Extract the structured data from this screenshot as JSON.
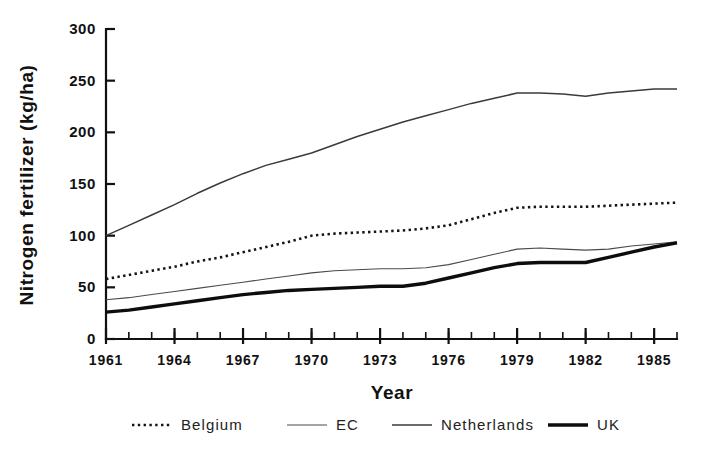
{
  "chart_data": {
    "type": "line",
    "title": "",
    "xlabel": "Year",
    "ylabel": "Nitrogen fertilizer (kg/ha)",
    "xlim": [
      1961,
      1986
    ],
    "ylim": [
      0,
      300
    ],
    "yticks": [
      0,
      50,
      100,
      150,
      200,
      250,
      300
    ],
    "ytick_labels": [
      "0",
      "50",
      "100",
      "150",
      "200",
      "250",
      "300"
    ],
    "xticks": [
      1961,
      1964,
      1967,
      1970,
      1973,
      1976,
      1979,
      1982,
      1985
    ],
    "xtick_labels": [
      "1961",
      "1964",
      "1967",
      "1970",
      "1973",
      "1976",
      "1979",
      "1982",
      "1985"
    ],
    "x_minor_interval": 1,
    "grid": false,
    "legend_position": "below",
    "x": [
      1961,
      1962,
      1963,
      1964,
      1965,
      1966,
      1967,
      1968,
      1969,
      1970,
      1971,
      1972,
      1973,
      1974,
      1975,
      1976,
      1977,
      1978,
      1979,
      1980,
      1981,
      1982,
      1983,
      1984,
      1985,
      1986
    ],
    "series": [
      {
        "name": "Belgium",
        "style": "dotted",
        "values": [
          58,
          62,
          66,
          70,
          75,
          79,
          84,
          89,
          94,
          100,
          102,
          103,
          104,
          105,
          107,
          110,
          116,
          122,
          127,
          128,
          128,
          128,
          129,
          130,
          131,
          132
        ]
      },
      {
        "name": "EC",
        "style": "thin",
        "values": [
          38,
          40,
          43,
          46,
          49,
          52,
          55,
          58,
          61,
          64,
          66,
          67,
          68,
          68,
          69,
          72,
          77,
          82,
          87,
          88,
          87,
          86,
          87,
          90,
          92,
          94
        ]
      },
      {
        "name": "Netherlands",
        "style": "medium",
        "values": [
          100,
          110,
          120,
          130,
          141,
          151,
          160,
          168,
          174,
          180,
          188,
          196,
          203,
          210,
          216,
          222,
          228,
          233,
          238,
          238,
          237,
          235,
          238,
          240,
          242,
          242
        ]
      },
      {
        "name": "UK",
        "style": "thick",
        "values": [
          26,
          28,
          31,
          34,
          37,
          40,
          43,
          45,
          47,
          48,
          49,
          50,
          51,
          51,
          54,
          59,
          64,
          69,
          73,
          74,
          74,
          74,
          79,
          84,
          89,
          93
        ]
      }
    ]
  },
  "legend": {
    "items": [
      {
        "label": "Belgium"
      },
      {
        "label": "EC"
      },
      {
        "label": "Netherlands"
      },
      {
        "label": "UK"
      }
    ]
  }
}
